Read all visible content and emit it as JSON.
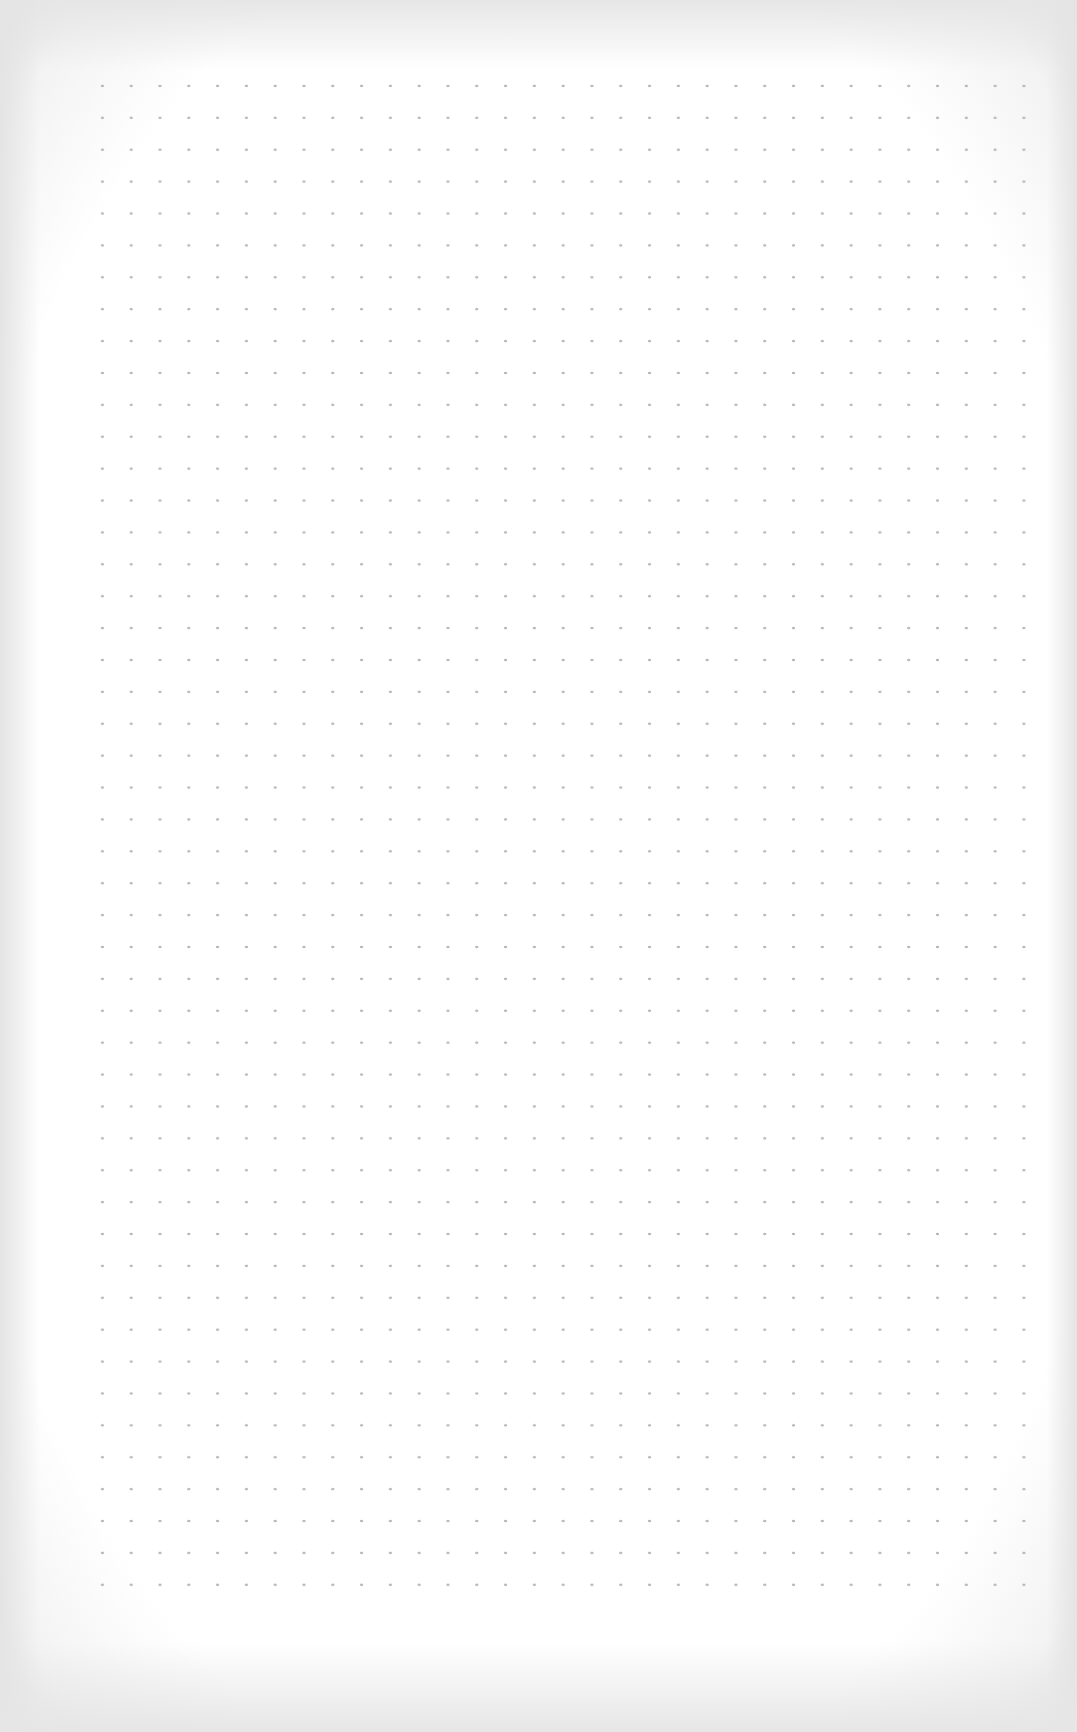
{
  "page": {
    "type": "dot-grid-paper",
    "content": "",
    "grid": {
      "columns": 34,
      "rows": 49,
      "dot_color": "#b8b8b8",
      "paper_color": "#ffffff",
      "edge_shadow_color": "#e6e6e6"
    }
  }
}
